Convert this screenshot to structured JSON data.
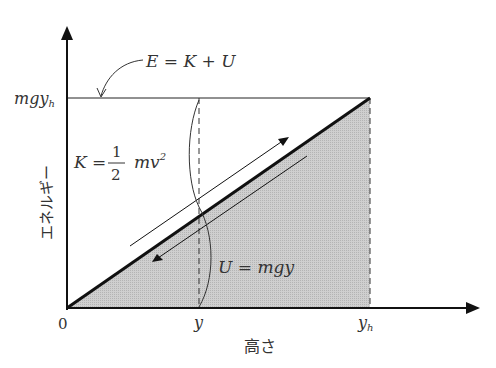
{
  "diagram": {
    "title": "",
    "axes": {
      "x_label": "高さ",
      "y_label": "エネルギー",
      "origin_label": "0",
      "x_ticks": [
        {
          "label": "y",
          "sub": ""
        },
        {
          "label": "y",
          "sub": "h"
        }
      ],
      "y_ticks": [
        {
          "label": "mgy",
          "sub": "h"
        }
      ]
    },
    "annotations": {
      "total_energy": "E = K + U",
      "kinetic_lhs": "K =",
      "kinetic_num": "1",
      "kinetic_den": "2",
      "kinetic_rhs": "mv",
      "kinetic_sup": "2",
      "potential": "U = mgy"
    },
    "colors": {
      "line": "#111111",
      "fill": "#c8c8c8",
      "text": "#333333"
    }
  }
}
